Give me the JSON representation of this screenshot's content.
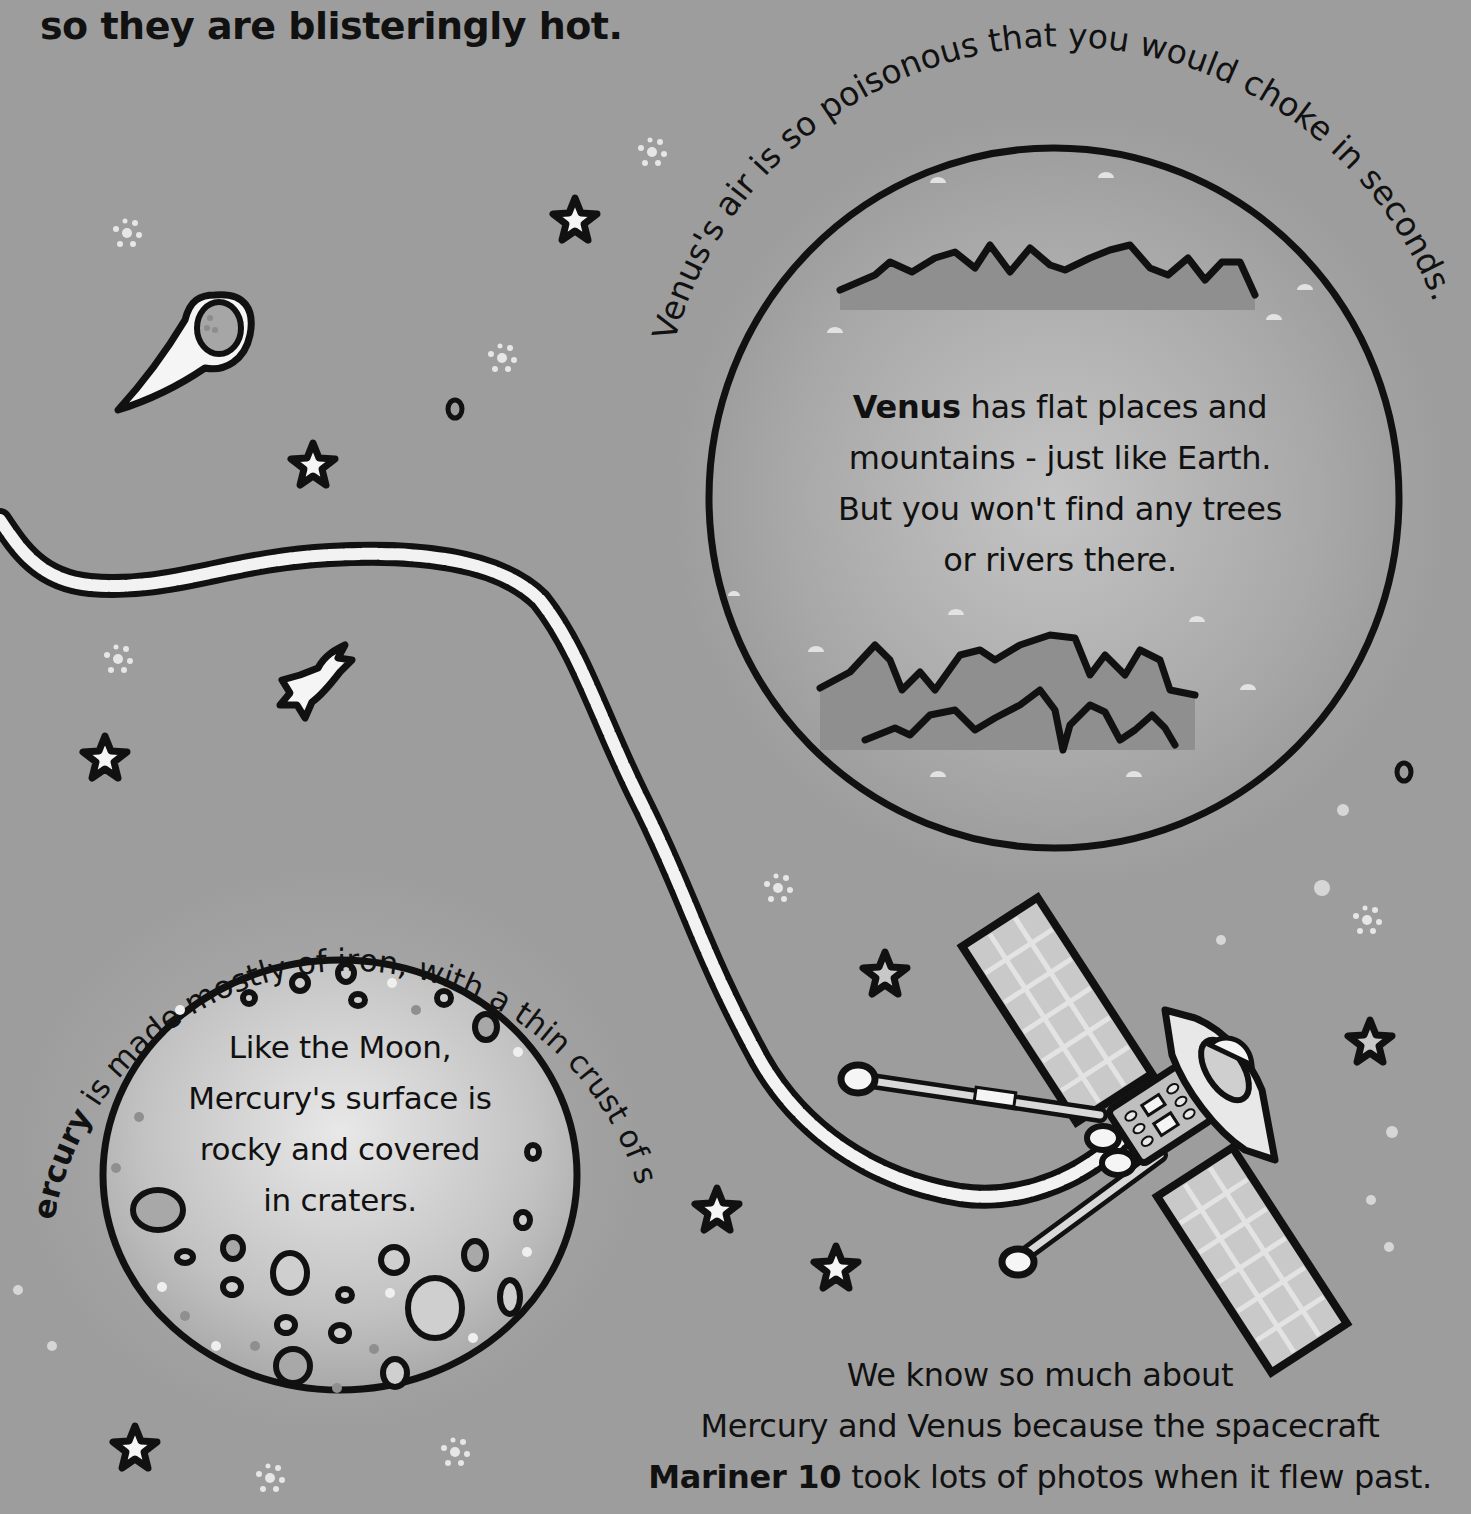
{
  "page": {
    "top_line": "so they are blisteringly hot."
  },
  "venus": {
    "arc_caption": "Venus's air is so poisonous that you would choke in seconds.",
    "body_bold": "Venus",
    "body_line1_rest": " has flat places and",
    "body_line2": "mountains - just like Earth.",
    "body_line3": "But you won't find any trees",
    "body_line4": "or rivers there."
  },
  "mercury": {
    "arc_caption_bold": "Mercury",
    "arc_caption_rest": " is made mostly of iron, with a thin crust of soil.",
    "body_line1": "Like the Moon,",
    "body_line2": "Mercury's surface is",
    "body_line3": "rocky and covered",
    "body_line4": "in craters."
  },
  "mariner": {
    "line1": "We know so much about",
    "line2": "Mercury and Venus because the spacecraft",
    "line3_bold": "Mariner 10",
    "line3_rest": " took lots of photos when it flew past."
  },
  "illustrations": {
    "icons": [
      "comet-icon",
      "star-icon",
      "shooting-star-icon",
      "sparkle-cluster-icon",
      "spacecraft-icon",
      "planet-venus",
      "planet-mercury",
      "wavy-trail"
    ]
  },
  "colors": {
    "background": "#9d9d9d",
    "venus_fill": "#a9a9a9",
    "mercury_fill": "#c9c9c9",
    "outline": "#111111",
    "trail_fill": "#f2f2f2"
  }
}
